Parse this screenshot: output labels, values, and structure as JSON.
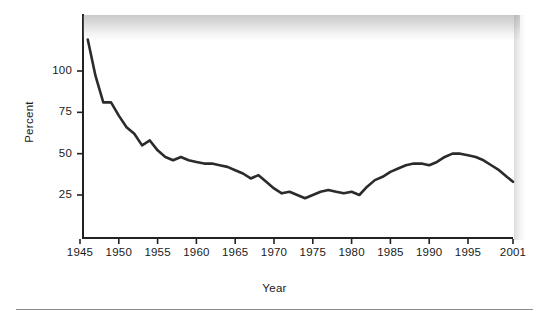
{
  "axes": {
    "ylabel": "Percent",
    "xlabel": "Year",
    "yticks": [
      "100",
      "75",
      "50",
      "25"
    ],
    "xticks": [
      "1945",
      "1950",
      "1955",
      "1960",
      "1965",
      "1970",
      "1975",
      "1980",
      "1985",
      "1990",
      "1995",
      "2001"
    ]
  },
  "style": {
    "line_color": "#2b2b2b",
    "axis_color": "#222222",
    "background": "#ffffff"
  },
  "chart_data": {
    "type": "line",
    "title": "",
    "xlabel": "Year",
    "ylabel": "Percent",
    "xlim": [
      1945,
      2001
    ],
    "ylim": [
      0,
      125
    ],
    "yticks": [
      25,
      50,
      75,
      100
    ],
    "xticks": [
      1945,
      1950,
      1955,
      1960,
      1965,
      1970,
      1975,
      1980,
      1985,
      1990,
      1995,
      2001
    ],
    "grid": false,
    "legend": null,
    "series": [
      {
        "name": "Percent",
        "x": [
          1946,
          1947,
          1948,
          1949,
          1950,
          1951,
          1952,
          1953,
          1954,
          1955,
          1956,
          1957,
          1958,
          1959,
          1960,
          1961,
          1962,
          1963,
          1964,
          1965,
          1966,
          1967,
          1968,
          1969,
          1970,
          1971,
          1972,
          1973,
          1974,
          1975,
          1976,
          1977,
          1978,
          1979,
          1980,
          1981,
          1982,
          1983,
          1984,
          1985,
          1986,
          1987,
          1988,
          1989,
          1990,
          1991,
          1992,
          1993,
          1994,
          1995,
          1996,
          1997,
          1998,
          1999,
          2000,
          2001
        ],
        "y": [
          119,
          97,
          81,
          81,
          73,
          66,
          62,
          55,
          58,
          52,
          48,
          46,
          48,
          46,
          45,
          44,
          44,
          43,
          42,
          40,
          38,
          35,
          37,
          33,
          29,
          26,
          27,
          25,
          23,
          25,
          27,
          28,
          27,
          26,
          27,
          25,
          30,
          34,
          36,
          39,
          41,
          43,
          44,
          44,
          43,
          45,
          48,
          50,
          50,
          49,
          48,
          46,
          43,
          40,
          36,
          33
        ]
      }
    ]
  }
}
